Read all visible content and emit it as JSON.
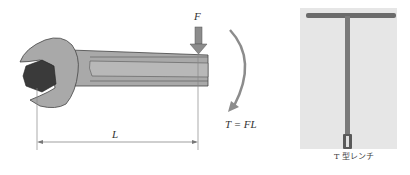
{
  "left_figure": {
    "force_label": "F",
    "length_label": "L",
    "torque_label": "T = FL",
    "colors": {
      "wrench_fill": "#a9a9a9",
      "wrench_outline": "#444444",
      "nut_fill": "#3a3a3a",
      "arrow_fill": "#8c8c8c",
      "dimension_line": "#777777"
    }
  },
  "right_figure": {
    "caption": "T 型レンチ",
    "colors": {
      "photo_bg": "#e6e6e6",
      "tool": "#6b6b6b"
    }
  }
}
